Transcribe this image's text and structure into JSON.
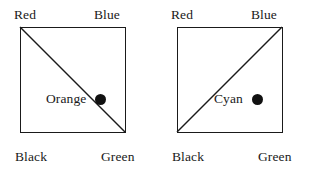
{
  "figure": {
    "background_color": "#ffffff",
    "line_color": "#1a1a1a",
    "dot_color": "#111111"
  },
  "panels": [
    {
      "id": "left-panel",
      "corners": {
        "top_left": "Red",
        "top_right": "Blue",
        "bottom_left": "Black",
        "bottom_right": "Green"
      },
      "diagonal": {
        "from": "top-left",
        "to": "bottom-right",
        "description": "Red to Green diagonal"
      },
      "point": {
        "label": "Orange",
        "on_diagonal": true,
        "x_fraction": 0.76,
        "y_fraction": 0.69
      }
    },
    {
      "id": "right-panel",
      "corners": {
        "top_left": "Red",
        "top_right": "Blue",
        "bottom_left": "Black",
        "bottom_right": "Green"
      },
      "diagonal": {
        "from": "bottom-left",
        "to": "top-right",
        "description": "Black to Blue diagonal"
      },
      "point": {
        "label": "Cyan",
        "on_diagonal": false,
        "x_fraction": 0.76,
        "y_fraction": 0.69
      }
    }
  ]
}
